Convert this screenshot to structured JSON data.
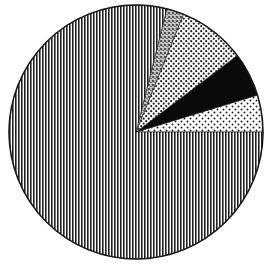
{
  "chart_data": {
    "type": "pie",
    "title": "",
    "legend": "none",
    "start_angle_deg": 0,
    "direction": "counterclockwise",
    "slices": [
      {
        "label": "",
        "pattern": "sparse-dots",
        "value": 4.7,
        "angle_deg": 17
      },
      {
        "label": "",
        "pattern": "solid-black",
        "value": 5.6,
        "angle_deg": 20
      },
      {
        "label": "",
        "pattern": "dense-dots",
        "value": 8.6,
        "angle_deg": 31
      },
      {
        "label": "",
        "pattern": "speckle",
        "value": 2.2,
        "angle_deg": 8
      },
      {
        "label": "",
        "pattern": "vertical-lines",
        "value": 78.9,
        "angle_deg": 284
      }
    ]
  },
  "colors": {
    "ink": "#1a1a1a",
    "paper": "#ffffff"
  }
}
